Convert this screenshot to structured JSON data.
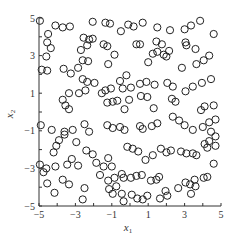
{
  "chart_data": {
    "type": "scatter",
    "title": "",
    "xlabel": "x1",
    "ylabel": "x2",
    "xlim": [
      -5,
      5
    ],
    "ylim": [
      -5,
      5
    ],
    "x_ticks": [
      -5,
      -3,
      -1,
      1,
      3,
      5
    ],
    "y_ticks": [
      -5,
      -3,
      -1,
      1,
      3,
      5
    ],
    "x_tick_labels": [
      "−5",
      "−3",
      "−1",
      "1",
      "3",
      "5"
    ],
    "y_tick_labels": [
      "−5",
      "−3",
      "−1",
      "1",
      "3",
      "5"
    ],
    "grid": false,
    "legend": null,
    "marker": "open-circle",
    "marker_color": "#222222",
    "series": [
      {
        "name": "samples",
        "points": [
          [
            -4.95,
            4.85
          ],
          [
            -4.1,
            4.6
          ],
          [
            -3.7,
            4.5
          ],
          [
            -3.3,
            4.55
          ],
          [
            -2.05,
            4.8
          ],
          [
            -1.35,
            4.75
          ],
          [
            -1.1,
            4.7
          ],
          [
            -0.1,
            4.65
          ],
          [
            0.7,
            4.75
          ],
          [
            0.2,
            4.55
          ],
          [
            -0.5,
            4.3
          ],
          [
            1.5,
            4.5
          ],
          [
            2.2,
            4.35
          ],
          [
            3.0,
            4.4
          ],
          [
            3.35,
            4.6
          ],
          [
            3.85,
            4.85
          ],
          [
            4.6,
            4.15
          ],
          [
            -4.5,
            4.15
          ],
          [
            -4.55,
            3.7
          ],
          [
            -4.35,
            3.4
          ],
          [
            -4.6,
            2.95
          ],
          [
            -2.55,
            3.95
          ],
          [
            -2.25,
            3.85
          ],
          [
            -2.05,
            3.9
          ],
          [
            -2.35,
            3.55
          ],
          [
            -2.7,
            3.3
          ],
          [
            -1.45,
            3.6
          ],
          [
            -1.25,
            3.5
          ],
          [
            -0.85,
            3.05
          ],
          [
            -1.2,
            2.55
          ],
          [
            -2.6,
            2.75
          ],
          [
            -2.3,
            2.7
          ],
          [
            0.35,
            3.6
          ],
          [
            0.55,
            3.6
          ],
          [
            1.45,
            3.75
          ],
          [
            1.75,
            3.6
          ],
          [
            3.05,
            3.7
          ],
          [
            3.1,
            3.55
          ],
          [
            1.25,
            3.1
          ],
          [
            1.5,
            3.2
          ],
          [
            1.85,
            3.05
          ],
          [
            2.15,
            3.25
          ],
          [
            2.0,
            2.95
          ],
          [
            3.6,
            3.35
          ],
          [
            4.35,
            3.0
          ],
          [
            4.05,
            2.75
          ],
          [
            3.65,
            2.55
          ],
          [
            1.0,
            2.65
          ],
          [
            2.85,
            2.35
          ],
          [
            -4.85,
            2.25
          ],
          [
            -4.55,
            2.2
          ],
          [
            -3.65,
            2.3
          ],
          [
            -2.85,
            2.35
          ],
          [
            -3.25,
            2.05
          ],
          [
            -2.6,
            1.75
          ],
          [
            -2.35,
            1.6
          ],
          [
            -1.95,
            1.55
          ],
          [
            -0.2,
            1.95
          ],
          [
            -0.55,
            1.65
          ],
          [
            0.05,
            1.3
          ],
          [
            -0.4,
            1.25
          ],
          [
            0.55,
            1.5
          ],
          [
            0.9,
            1.6
          ],
          [
            1.35,
            1.45
          ],
          [
            2.05,
            1.55
          ],
          [
            2.35,
            1.35
          ],
          [
            4.45,
            1.75
          ],
          [
            3.05,
            1.1
          ],
          [
            3.45,
            1.35
          ],
          [
            3.95,
            1.55
          ],
          [
            -3.35,
            1.0
          ],
          [
            -2.8,
            1.0
          ],
          [
            -2.45,
            1.15
          ],
          [
            -1.55,
            1.0
          ],
          [
            -1.35,
            1.15
          ],
          [
            -1.05,
            1.25
          ],
          [
            0.6,
            0.85
          ],
          [
            0.95,
            0.8
          ],
          [
            2.3,
            0.7
          ],
          [
            2.5,
            0.55
          ],
          [
            -1.25,
            0.5
          ],
          [
            -0.95,
            0.55
          ],
          [
            -0.7,
            0.6
          ],
          [
            -3.7,
            0.65
          ],
          [
            -3.55,
            0.35
          ],
          [
            -3.35,
            0.15
          ],
          [
            -0.3,
            0.15
          ],
          [
            -0.05,
            0.65
          ],
          [
            1.3,
            0.2
          ],
          [
            4.6,
            0.35
          ],
          [
            3.9,
            0.1
          ],
          [
            4.1,
            0.3
          ],
          [
            -4.9,
            -0.7
          ],
          [
            -4.3,
            -0.95
          ],
          [
            -3.15,
            -0.95
          ],
          [
            -2.5,
            -0.65
          ],
          [
            -2.25,
            -1.05
          ],
          [
            -1.25,
            -0.7
          ],
          [
            -0.95,
            -0.85
          ],
          [
            -0.55,
            -0.8
          ],
          [
            -0.3,
            -0.95
          ],
          [
            0.55,
            -0.75
          ],
          [
            0.7,
            -0.9
          ],
          [
            1.2,
            -0.75
          ],
          [
            1.5,
            -0.6
          ],
          [
            2.35,
            -0.25
          ],
          [
            2.7,
            -0.45
          ],
          [
            3.0,
            -0.7
          ],
          [
            3.45,
            -0.95
          ],
          [
            4.0,
            -0.8
          ],
          [
            4.35,
            -0.55
          ],
          [
            4.7,
            -0.4
          ],
          [
            -3.6,
            -1.05
          ],
          [
            -3.6,
            -1.2
          ],
          [
            -2.95,
            -1.6
          ],
          [
            -2.4,
            -2.05
          ],
          [
            -2.05,
            -2.25
          ],
          [
            -4.2,
            -2.15
          ],
          [
            -1.2,
            -2.45
          ],
          [
            -1.0,
            -2.9
          ],
          [
            -0.15,
            -1.85
          ],
          [
            0.15,
            -1.95
          ],
          [
            0.45,
            -2.1
          ],
          [
            0.85,
            -2.55
          ],
          [
            1.25,
            -2.3
          ],
          [
            1.7,
            -1.95
          ],
          [
            2.0,
            -2.15
          ],
          [
            2.25,
            -2.05
          ],
          [
            2.8,
            -2.1
          ],
          [
            3.1,
            -2.2
          ],
          [
            3.45,
            -2.2
          ],
          [
            3.65,
            -2.3
          ],
          [
            4.1,
            -1.7
          ],
          [
            4.35,
            -1.55
          ],
          [
            4.7,
            -1.3
          ],
          [
            4.45,
            -1.05
          ],
          [
            4.25,
            -1.9
          ],
          [
            4.7,
            -1.8
          ],
          [
            -4.95,
            -2.8
          ],
          [
            -4.6,
            -3.0
          ],
          [
            -4.75,
            -3.2
          ],
          [
            -4.1,
            -2.9
          ],
          [
            -3.45,
            -2.8
          ],
          [
            -3.2,
            -2.5
          ],
          [
            -2.85,
            -2.85
          ],
          [
            -1.85,
            -2.7
          ],
          [
            -1.45,
            -2.9
          ],
          [
            -3.7,
            -3.6
          ],
          [
            -3.35,
            -3.85
          ],
          [
            -4.55,
            -3.8
          ],
          [
            -4.15,
            -4.3
          ],
          [
            -1.65,
            -3.35
          ],
          [
            -1.2,
            -3.65
          ],
          [
            -2.5,
            -4.05
          ],
          [
            -2.6,
            -4.65
          ],
          [
            -0.85,
            -3.5
          ],
          [
            -0.45,
            -3.3
          ],
          [
            -0.35,
            -3.5
          ],
          [
            -0.75,
            -3.95
          ],
          [
            0.05,
            -3.5
          ],
          [
            0.35,
            -3.4
          ],
          [
            0.65,
            -3.35
          ],
          [
            -1.15,
            -4.1
          ],
          [
            -0.95,
            -4.35
          ],
          [
            -0.45,
            -4.35
          ],
          [
            -0.35,
            -4.75
          ],
          [
            0.1,
            -4.4
          ],
          [
            0.4,
            -4.6
          ],
          [
            0.7,
            -4.65
          ],
          [
            0.95,
            -4.45
          ],
          [
            1.65,
            -4.6
          ],
          [
            2.05,
            -4.45
          ],
          [
            2.65,
            -4.05
          ],
          [
            1.95,
            -4.2
          ],
          [
            3.05,
            -3.75
          ],
          [
            3.3,
            -3.85
          ],
          [
            3.6,
            -3.95
          ],
          [
            3.55,
            -3.6
          ],
          [
            4.05,
            -3.5
          ],
          [
            4.25,
            -3.45
          ],
          [
            3.35,
            -4.35
          ],
          [
            4.6,
            -2.75
          ],
          [
            1.15,
            -3.65
          ],
          [
            1.45,
            -3.6
          ],
          [
            1.6,
            -3.45
          ],
          [
            -4.05,
            -1.8
          ],
          [
            -3.9,
            -1.5
          ]
        ]
      }
    ]
  },
  "axes": {
    "xlabel_main": "x",
    "xlabel_sub": "1",
    "ylabel_main": "x",
    "ylabel_sub": "2"
  }
}
